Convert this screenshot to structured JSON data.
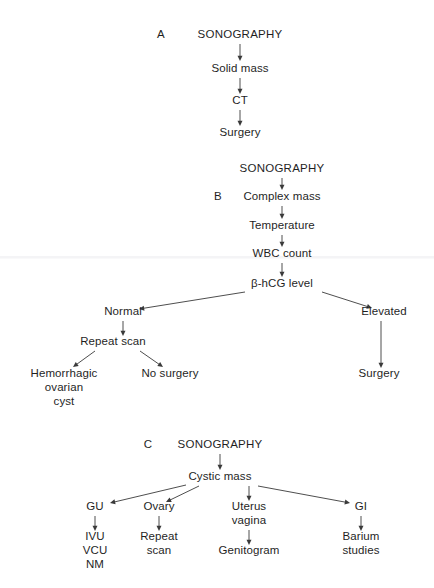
{
  "figure": {
    "type": "flowchart",
    "background_color": "#ffffff",
    "text_color": "#1f1f1f",
    "connector_color": "#3a3a3a",
    "panels": [
      {
        "id": "A",
        "label": "A",
        "label_x": 161,
        "label_y": 38,
        "nodes": [
          {
            "name": "sonography",
            "lines": [
              "SONOGRAPHY"
            ],
            "x": 240,
            "y": 38,
            "style": "title"
          },
          {
            "name": "solid-mass",
            "lines": [
              "Solid mass"
            ],
            "x": 240,
            "y": 72,
            "style": "plain"
          },
          {
            "name": "ct",
            "lines": [
              "CT"
            ],
            "x": 240,
            "y": 104,
            "style": "plain"
          },
          {
            "name": "surgery",
            "lines": [
              "Surgery"
            ],
            "x": 240,
            "y": 136,
            "style": "plain"
          }
        ],
        "arrows": [
          {
            "from": "sonography",
            "to": "solid-mass",
            "x1": 240,
            "y1": 44,
            "x2": 240,
            "y2": 61
          },
          {
            "from": "solid-mass",
            "to": "ct",
            "x1": 240,
            "y1": 78,
            "x2": 240,
            "y2": 94
          },
          {
            "from": "ct",
            "to": "surgery",
            "x1": 240,
            "y1": 110,
            "x2": 240,
            "y2": 126
          }
        ]
      },
      {
        "id": "B",
        "label": "B",
        "label_x": 218,
        "label_y": 200,
        "nodes": [
          {
            "name": "sonography",
            "lines": [
              "SONOGRAPHY"
            ],
            "x": 282,
            "y": 172,
            "style": "title"
          },
          {
            "name": "complex-mass",
            "lines": [
              "Complex mass"
            ],
            "x": 282,
            "y": 200,
            "style": "plain"
          },
          {
            "name": "temperature",
            "lines": [
              "Temperature"
            ],
            "x": 282,
            "y": 229,
            "style": "plain"
          },
          {
            "name": "wbc-count",
            "lines": [
              "WBC count"
            ],
            "x": 282,
            "y": 257,
            "style": "plain"
          },
          {
            "name": "bhcg-level",
            "lines": [
              "β-hCG level"
            ],
            "x": 282,
            "y": 287,
            "style": "plain"
          },
          {
            "name": "normal",
            "lines": [
              "Normal"
            ],
            "x": 123,
            "y": 315,
            "style": "plain"
          },
          {
            "name": "elevated",
            "lines": [
              "Elevated"
            ],
            "x": 384,
            "y": 315,
            "style": "plain"
          },
          {
            "name": "repeat-scan",
            "lines": [
              "Repeat scan"
            ],
            "x": 113,
            "y": 345,
            "style": "plain"
          },
          {
            "name": "hemorrhagic-ovarian-cyst",
            "lines": [
              "Hemorrhagic",
              "ovarian",
              "cyst"
            ],
            "x": 64,
            "y": 377,
            "style": "plain"
          },
          {
            "name": "no-surgery",
            "lines": [
              "No surgery"
            ],
            "x": 170,
            "y": 377,
            "style": "plain"
          },
          {
            "name": "surgery",
            "lines": [
              "Surgery"
            ],
            "x": 379,
            "y": 377,
            "style": "plain"
          }
        ],
        "arrows": [
          {
            "from": "sonography",
            "to": "complex-mass",
            "x1": 282,
            "y1": 178,
            "x2": 282,
            "y2": 190
          },
          {
            "from": "complex-mass",
            "to": "temperature",
            "x1": 282,
            "y1": 206,
            "x2": 282,
            "y2": 219
          },
          {
            "from": "temperature",
            "to": "wbc-count",
            "x1": 282,
            "y1": 235,
            "x2": 282,
            "y2": 247
          },
          {
            "from": "wbc-count",
            "to": "bhcg-level",
            "x1": 282,
            "y1": 263,
            "x2": 282,
            "y2": 277
          },
          {
            "from": "bhcg-level",
            "to": "normal",
            "x1": 245,
            "y1": 292,
            "x2": 139,
            "y2": 309
          },
          {
            "from": "bhcg-level",
            "to": "elevated",
            "x1": 322,
            "y1": 292,
            "x2": 372,
            "y2": 308
          },
          {
            "from": "normal",
            "to": "repeat-scan",
            "x1": 123,
            "y1": 321,
            "x2": 123,
            "y2": 336
          },
          {
            "from": "elevated",
            "to": "surgery",
            "x1": 381,
            "y1": 321,
            "x2": 381,
            "y2": 368
          },
          {
            "from": "repeat-scan",
            "to": "hemorrhagic-ovarian-cyst",
            "x1": 95,
            "y1": 351,
            "x2": 73,
            "y2": 367
          },
          {
            "from": "repeat-scan",
            "to": "no-surgery",
            "x1": 140,
            "y1": 351,
            "x2": 163,
            "y2": 367
          }
        ]
      },
      {
        "id": "C",
        "label": "C",
        "label_x": 148,
        "label_y": 448,
        "nodes": [
          {
            "name": "sonography",
            "lines": [
              "SONOGRAPHY"
            ],
            "x": 220,
            "y": 448,
            "style": "title"
          },
          {
            "name": "cystic-mass",
            "lines": [
              "Cystic mass"
            ],
            "x": 220,
            "y": 480,
            "style": "plain"
          },
          {
            "name": "gu",
            "lines": [
              "GU"
            ],
            "x": 95,
            "y": 510,
            "style": "plain"
          },
          {
            "name": "ovary",
            "lines": [
              "Ovary"
            ],
            "x": 159,
            "y": 510,
            "style": "plain"
          },
          {
            "name": "uterus-vagina",
            "lines": [
              "Uterus",
              "vagina"
            ],
            "x": 249,
            "y": 510,
            "style": "plain"
          },
          {
            "name": "gi",
            "lines": [
              "GI"
            ],
            "x": 361,
            "y": 510,
            "style": "plain"
          },
          {
            "name": "ivu-vcu-nm",
            "lines": [
              "IVU",
              "VCU",
              "NM"
            ],
            "x": 95,
            "y": 540,
            "style": "plain"
          },
          {
            "name": "repeat-scan",
            "lines": [
              "Repeat",
              "scan"
            ],
            "x": 159,
            "y": 540,
            "style": "plain"
          },
          {
            "name": "genitogram",
            "lines": [
              "Genitogram"
            ],
            "x": 249,
            "y": 554,
            "style": "plain"
          },
          {
            "name": "barium-studies",
            "lines": [
              "Barium",
              "studies"
            ],
            "x": 361,
            "y": 540,
            "style": "plain"
          }
        ],
        "arrows": [
          {
            "from": "sonography",
            "to": "cystic-mass",
            "x1": 220,
            "y1": 454,
            "x2": 220,
            "y2": 470
          },
          {
            "from": "cystic-mass",
            "to": "gu",
            "x1": 186,
            "y1": 485,
            "x2": 110,
            "y2": 503
          },
          {
            "from": "cystic-mass",
            "to": "ovary",
            "x1": 199,
            "y1": 486,
            "x2": 166,
            "y2": 502
          },
          {
            "from": "cystic-mass",
            "to": "uterus-vagina",
            "x1": 249,
            "y1": 486,
            "x2": 249,
            "y2": 501
          },
          {
            "from": "cystic-mass",
            "to": "gi",
            "x1": 258,
            "y1": 486,
            "x2": 350,
            "y2": 503
          },
          {
            "from": "gu",
            "to": "ivu-vcu-nm",
            "x1": 95,
            "y1": 516,
            "x2": 95,
            "y2": 531
          },
          {
            "from": "ovary",
            "to": "repeat-scan",
            "x1": 159,
            "y1": 516,
            "x2": 159,
            "y2": 531
          },
          {
            "from": "uterus-vagina",
            "to": "genitogram",
            "x1": 249,
            "y1": 530,
            "x2": 249,
            "y2": 545
          },
          {
            "from": "gi",
            "to": "barium-studies",
            "x1": 361,
            "y1": 516,
            "x2": 361,
            "y2": 531
          }
        ]
      }
    ]
  }
}
